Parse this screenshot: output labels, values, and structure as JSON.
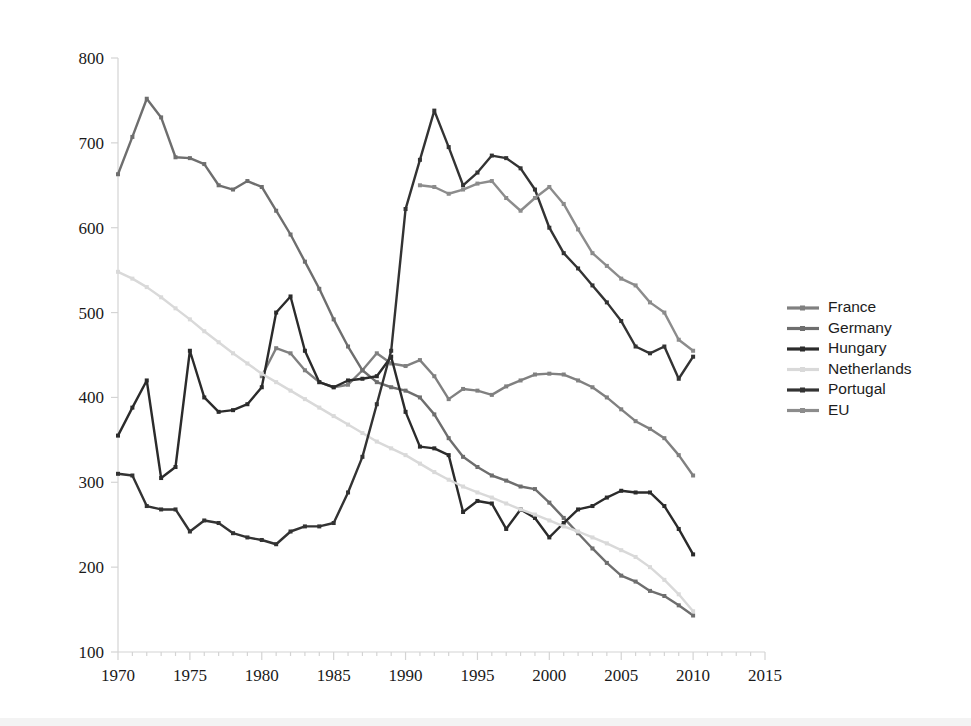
{
  "chart_data": {
    "type": "line",
    "title": "",
    "subtitle": "",
    "xlabel": "",
    "ylabel": "",
    "xlim": [
      1970,
      2015
    ],
    "ylim": [
      100,
      800
    ],
    "x_ticks": [
      1970,
      1975,
      1980,
      1985,
      1990,
      1995,
      2000,
      2005,
      2010,
      2015
    ],
    "y_ticks": [
      100,
      200,
      300,
      400,
      500,
      600,
      700,
      800
    ],
    "x_minor_tick_step": 1,
    "grid": false,
    "legend_position": "right",
    "series": [
      {
        "name": "France",
        "color": "#808080",
        "x": [
          1980,
          1981,
          1982,
          1983,
          1984,
          1985,
          1986,
          1987,
          1988,
          1989,
          1990,
          1991,
          1992,
          1993,
          1994,
          1995,
          1996,
          1997,
          1998,
          1999,
          2000,
          2001,
          2002,
          2003,
          2004,
          2005,
          2006,
          2007,
          2008,
          2009,
          2010
        ],
        "values": [
          425,
          458,
          452,
          432,
          418,
          412,
          415,
          432,
          452,
          440,
          437,
          444,
          425,
          398,
          410,
          408,
          403,
          413,
          420,
          427,
          428,
          427,
          420,
          412,
          400,
          386,
          372,
          363,
          352,
          332,
          308
        ]
      },
      {
        "name": "Germany",
        "color": "#6e6e6e",
        "x": [
          1970,
          1971,
          1972,
          1973,
          1974,
          1975,
          1976,
          1977,
          1978,
          1979,
          1980,
          1981,
          1982,
          1983,
          1984,
          1985,
          1986,
          1987,
          1988,
          1989,
          1990,
          1991,
          1992,
          1993,
          1994,
          1995,
          1996,
          1997,
          1998,
          1999,
          2000,
          2001,
          2002,
          2003,
          2004,
          2005,
          2006,
          2007,
          2008,
          2009,
          2010
        ],
        "values": [
          663,
          707,
          752,
          730,
          683,
          682,
          675,
          650,
          645,
          655,
          648,
          620,
          592,
          560,
          528,
          492,
          460,
          432,
          418,
          412,
          408,
          400,
          380,
          352,
          330,
          318,
          308,
          302,
          295,
          292,
          276,
          258,
          240,
          222,
          205,
          190,
          183,
          172,
          166,
          155,
          143
        ]
      },
      {
        "name": "Hungary",
        "color": "#2b2b2b",
        "x": [
          1970,
          1971,
          1972,
          1973,
          1974,
          1975,
          1976,
          1977,
          1978,
          1979,
          1980,
          1981,
          1982,
          1983,
          1984,
          1985,
          1986,
          1987,
          1988,
          1989,
          1990,
          1991,
          1992,
          1993,
          1994,
          1995,
          1996,
          1997,
          1998,
          1999,
          2000,
          2001,
          2002,
          2003,
          2004,
          2005,
          2006,
          2007,
          2008,
          2009,
          2010
        ],
        "values": [
          355,
          388,
          420,
          305,
          318,
          455,
          400,
          383,
          385,
          392,
          412,
          500,
          519,
          455,
          418,
          412,
          420,
          422,
          425,
          448,
          383,
          342,
          340,
          332,
          265,
          278,
          275,
          245,
          268,
          258,
          235,
          252,
          268,
          272,
          282,
          290,
          288,
          288,
          272,
          245,
          215
        ]
      },
      {
        "name": "Netherlands",
        "color": "#d9d9d9",
        "x": [
          1970,
          1971,
          1972,
          1973,
          1974,
          1975,
          1976,
          1977,
          1978,
          1979,
          1980,
          1981,
          1982,
          1983,
          1984,
          1985,
          1986,
          1987,
          1988,
          1989,
          1990,
          1991,
          1992,
          1993,
          1994,
          1995,
          1996,
          1997,
          1998,
          1999,
          2000,
          2001,
          2002,
          2003,
          2004,
          2005,
          2006,
          2007,
          2008,
          2009,
          2010
        ],
        "values": [
          548,
          540,
          530,
          518,
          505,
          492,
          478,
          465,
          452,
          440,
          428,
          418,
          408,
          398,
          388,
          378,
          368,
          358,
          348,
          340,
          332,
          322,
          312,
          303,
          295,
          288,
          282,
          275,
          268,
          262,
          255,
          248,
          242,
          235,
          228,
          220,
          212,
          200,
          185,
          168,
          148
        ]
      },
      {
        "name": "Portugal",
        "color": "#333333",
        "x": [
          1970,
          1971,
          1972,
          1973,
          1974,
          1975,
          1976,
          1977,
          1978,
          1979,
          1980,
          1981,
          1982,
          1983,
          1984,
          1985,
          1986,
          1987,
          1988,
          1989,
          1990,
          1991,
          1992,
          1993,
          1994,
          1995,
          1996,
          1997,
          1998,
          1999,
          2000,
          2001,
          2002,
          2003,
          2004,
          2005,
          2006,
          2007,
          2008,
          2009,
          2010
        ],
        "values": [
          310,
          308,
          272,
          268,
          268,
          242,
          255,
          252,
          240,
          235,
          232,
          227,
          242,
          248,
          248,
          252,
          288,
          330,
          392,
          455,
          622,
          680,
          738,
          695,
          650,
          665,
          685,
          682,
          670,
          645,
          600,
          570,
          552,
          532,
          512,
          490,
          460,
          452,
          460,
          422,
          448
        ]
      },
      {
        "name": "EU",
        "color": "#8c8c8c",
        "x": [
          1991,
          1992,
          1993,
          1994,
          1995,
          1996,
          1997,
          1998,
          1999,
          2000,
          2001,
          2002,
          2003,
          2004,
          2005,
          2006,
          2007,
          2008,
          2009,
          2010
        ],
        "values": [
          650,
          648,
          640,
          645,
          652,
          655,
          635,
          620,
          635,
          648,
          628,
          598,
          570,
          555,
          540,
          532,
          512,
          500,
          468,
          455
        ]
      }
    ]
  },
  "legend": {
    "items": [
      {
        "label": "France",
        "color": "#808080"
      },
      {
        "label": "Germany",
        "color": "#6e6e6e"
      },
      {
        "label": "Hungary",
        "color": "#2b2b2b"
      },
      {
        "label": "Netherlands",
        "color": "#d9d9d9"
      },
      {
        "label": "Portugal",
        "color": "#333333"
      },
      {
        "label": "EU",
        "color": "#8c8c8c"
      }
    ]
  },
  "axes": {
    "y_tick_labels": [
      "800",
      "700",
      "600",
      "500",
      "400",
      "300",
      "200",
      "100"
    ],
    "x_tick_labels": [
      "1970",
      "1975",
      "1980",
      "1985",
      "1990",
      "1995",
      "2000",
      "2005",
      "2010",
      "2015"
    ],
    "axis_color": "#d4d4d4"
  }
}
